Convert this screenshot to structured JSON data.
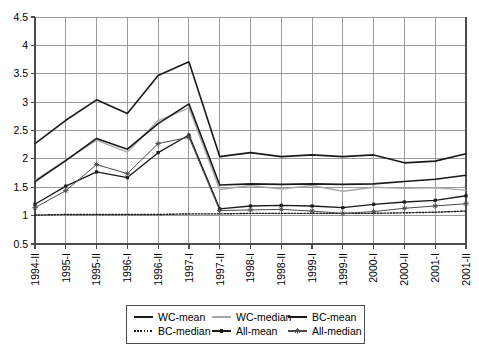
{
  "chart_data": {
    "type": "line",
    "title": "",
    "xlabel": "",
    "ylabel": "",
    "ylim": [
      0.5,
      4.5
    ],
    "ytick_step": 0.5,
    "grid": true,
    "legend_position": "bottom",
    "yticks": [
      "0.5",
      "1",
      "1.5",
      "2",
      "2.5",
      "3",
      "3.5",
      "4",
      "4.5"
    ],
    "categories": [
      "1994-II",
      "1995-I",
      "1995-II",
      "1996-I",
      "1996-II",
      "1997-I",
      "1997-II",
      "1998-I",
      "1998-II",
      "1999-I",
      "1999-II",
      "2000-I",
      "2000-II",
      "2001-I",
      "2001-II"
    ],
    "series": [
      {
        "name": "WC-mean",
        "color": "#1a1a1a",
        "style": "solid",
        "width": 1.6,
        "marker": "none",
        "values": [
          2.27,
          2.68,
          3.04,
          2.8,
          3.47,
          3.71,
          2.04,
          2.11,
          2.04,
          2.07,
          2.04,
          2.07,
          1.93,
          1.96,
          2.09
        ]
      },
      {
        "name": "WC-median",
        "color": "#a8a8a8",
        "style": "solid",
        "width": 1.4,
        "marker": "none",
        "values": [
          1.62,
          1.98,
          2.33,
          2.12,
          2.67,
          2.9,
          1.46,
          1.53,
          1.47,
          1.53,
          1.43,
          1.5,
          1.48,
          1.49,
          1.45
        ]
      },
      {
        "name": "BC-mean",
        "color": "#1a1a1a",
        "style": "solid",
        "width": 1.6,
        "marker": "none",
        "values": [
          1.6,
          1.97,
          2.36,
          2.17,
          2.62,
          2.97,
          1.54,
          1.56,
          1.55,
          1.56,
          1.55,
          1.56,
          1.6,
          1.64,
          1.71
        ]
      },
      {
        "name": "BC-median",
        "color": "#1a1a1a",
        "style": "dotted",
        "width": 1.4,
        "marker": "none",
        "values": [
          1.01,
          1.02,
          1.02,
          1.02,
          1.02,
          1.03,
          1.03,
          1.04,
          1.04,
          1.04,
          1.04,
          1.04,
          1.05,
          1.06,
          1.08
        ]
      },
      {
        "name": "All-mean",
        "color": "#1a1a1a",
        "style": "solid",
        "width": 1.3,
        "marker": "dot",
        "values": [
          1.2,
          1.52,
          1.77,
          1.67,
          2.11,
          2.42,
          1.12,
          1.17,
          1.18,
          1.17,
          1.14,
          1.2,
          1.24,
          1.27,
          1.35
        ]
      },
      {
        "name": "All-median",
        "color": "#4a4a4a",
        "style": "solid",
        "width": 1.0,
        "marker": "star",
        "values": [
          1.14,
          1.44,
          1.9,
          1.74,
          2.27,
          2.38,
          1.09,
          1.1,
          1.11,
          1.08,
          1.04,
          1.07,
          1.13,
          1.17,
          1.21
        ]
      }
    ],
    "legend": [
      {
        "label": "WC-mean",
        "color": "#1a1a1a",
        "style": "solid",
        "marker": "none"
      },
      {
        "label": "WC-median",
        "color": "#a8a8a8",
        "style": "solid",
        "marker": "none"
      },
      {
        "label": "BC-mean",
        "color": "#1a1a1a",
        "style": "solid",
        "marker": "none"
      },
      {
        "label": "BC-median",
        "color": "#1a1a1a",
        "style": "dotted",
        "marker": "none"
      },
      {
        "label": "All-mean",
        "color": "#1a1a1a",
        "style": "solid",
        "marker": "dot"
      },
      {
        "label": "All-median",
        "color": "#4a4a4a",
        "style": "solid",
        "marker": "star"
      }
    ],
    "colors": {
      "axis": "#4d4d4d",
      "grid": "#9a9a9a",
      "background": "#ffffff",
      "text": "#000000",
      "legend_border": "#4d4d4d"
    }
  }
}
